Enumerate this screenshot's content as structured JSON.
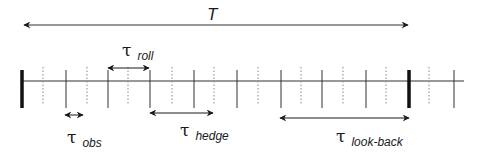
{
  "diagram": {
    "total_label": "T",
    "axis": {
      "y": 81,
      "x_start": 22,
      "x_end": 464,
      "solid_ticks": [
        66,
        108,
        150,
        194,
        237,
        281,
        322,
        366,
        454
      ],
      "dotted_ticks": [
        43,
        87,
        128,
        172,
        214,
        258,
        301,
        343,
        386,
        429
      ],
      "thick_ticks": [
        22,
        409
      ]
    },
    "spans": [
      {
        "id": "T",
        "symbol": "",
        "subscript": "",
        "label": "T",
        "x1": 24,
        "x2": 408,
        "y": 25
      },
      {
        "id": "roll",
        "symbol": "τ",
        "subscript": "roll",
        "x1": 108,
        "x2": 149,
        "y": 68
      },
      {
        "id": "obs",
        "symbol": "τ",
        "subscript": "obs",
        "x1": 65,
        "x2": 83,
        "y": 115
      },
      {
        "id": "hedge",
        "symbol": "τ",
        "subscript": "hedge",
        "x1": 150,
        "x2": 213,
        "y": 113
      },
      {
        "id": "look-back",
        "symbol": "τ",
        "subscript": "look-back",
        "x1": 280,
        "x2": 409,
        "y": 118
      }
    ],
    "labels": {
      "roll_symbol": "τ",
      "roll_sub": "roll",
      "obs_symbol": "τ",
      "obs_sub": "obs",
      "hedge_symbol": "τ",
      "hedge_sub": "hedge",
      "lookback_symbol": "τ",
      "lookback_sub": "look-back"
    },
    "colors": {
      "line": "#1a1a1a",
      "axis": "#333333",
      "dotted": "#888888"
    }
  }
}
